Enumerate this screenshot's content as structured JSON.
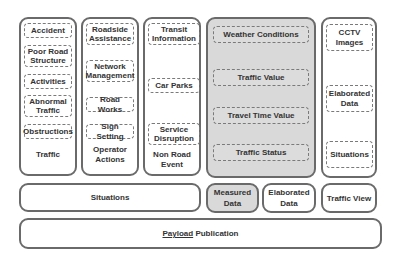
{
  "columns": {
    "traffic": {
      "label": "Traffic",
      "items": [
        "Accident",
        "Poor Road Structure",
        "Activities",
        "Abnormal Traffic",
        "Obstructions"
      ]
    },
    "operator_actions": {
      "label": "Operator Actions",
      "items": [
        "Roadside Assistance",
        "Network Management",
        "Road Works",
        "Sign Setting"
      ]
    },
    "non_road_event": {
      "label": "Non Road Event",
      "items": [
        "Transit Information",
        "Car Parks",
        "Service Disruption"
      ]
    },
    "measured": {
      "items": [
        "Weather Conditions",
        "Traffic Value",
        "Travel Time Value",
        "Traffic Status"
      ]
    },
    "traffic_view_col": {
      "items": [
        "CCTV Images",
        "Elaborated Data",
        "Situations"
      ]
    }
  },
  "bottom_row": {
    "situations": "Situations",
    "measured_data": "Measured Data",
    "elaborated_data": "Elaborated Data",
    "traffic_view": "Traffic View"
  },
  "payload": {
    "underlined": "Payload",
    "rest": " Publication"
  },
  "colors": {
    "border": "#6a6a6a",
    "measured_fill": "#d9d9d9",
    "background": "#ffffff"
  }
}
